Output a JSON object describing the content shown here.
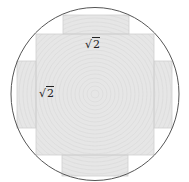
{
  "diagram": {
    "labels": {
      "top_side": {
        "symbol": "√",
        "value": "2"
      },
      "left_side": {
        "symbol": "√",
        "value": "2"
      }
    },
    "colors": {
      "circle_stroke": "#555555",
      "fill": "#e6e6e6",
      "ring_texture": "#d8d8d8",
      "edge": "#cfcfcf",
      "background": "#ffffff"
    }
  }
}
